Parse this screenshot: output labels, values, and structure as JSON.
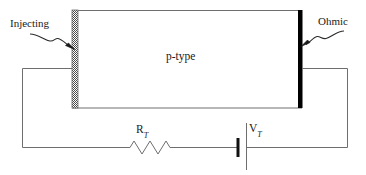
{
  "figure": {
    "labels": {
      "injecting": "Injecting",
      "ohmic": "Ohmic",
      "material_prefix": "p",
      "material_suffix": "-type",
      "resistor_symbol": "R",
      "resistor_subscript": "T",
      "voltage_symbol": "V",
      "voltage_subscript": "T"
    },
    "colors": {
      "line": "#6e6e6e",
      "contact_ohmic": "#000000",
      "contact_injecting": "#555555",
      "text": "#1a1a1a",
      "background": "#ffffff"
    },
    "geometry": {
      "bar_left_x": 72,
      "bar_right_x": 302,
      "bar_top_y": 10,
      "bar_bottom_y": 108,
      "wire_tap_y": 68,
      "bottom_wire_y": 147,
      "left_wire_x": 22,
      "right_wire_x": 348,
      "resistor_start_x": 130,
      "resistor_end_x": 170,
      "battery_short_plate_x": 238,
      "battery_long_plate_x": 246
    }
  }
}
